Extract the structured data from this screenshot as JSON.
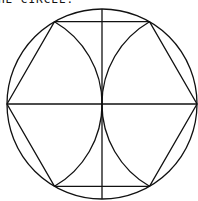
{
  "caption": {
    "text": "HE CIRCLE."
  },
  "diagram": {
    "colors": {
      "stroke": "#111111",
      "background": "#ffffff"
    },
    "circle": {
      "cx": 102,
      "cy": 104,
      "r": 95
    },
    "hexagon_vertices": [
      [
        7,
        104
      ],
      [
        54.5,
        21.7
      ],
      [
        149.5,
        21.7
      ],
      [
        197,
        104
      ],
      [
        149.5,
        186.3
      ],
      [
        54.5,
        186.3
      ]
    ],
    "diameters": {
      "vertical": [
        [
          102,
          9
        ],
        [
          102,
          199
        ]
      ],
      "horizontal": [
        [
          7,
          104
        ],
        [
          197,
          104
        ]
      ]
    },
    "arcs": [
      {
        "center": [
          7,
          104
        ],
        "radius": 95,
        "from": [
          54.5,
          21.7
        ],
        "to": [
          54.5,
          186.3
        ]
      },
      {
        "center": [
          197,
          104
        ],
        "radius": 95,
        "from": [
          149.5,
          21.7
        ],
        "to": [
          149.5,
          186.3
        ]
      }
    ]
  }
}
